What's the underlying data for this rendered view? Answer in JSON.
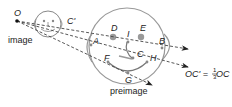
{
  "diagram": {
    "type": "dilation",
    "center_label": "O",
    "image_caption": "image",
    "preimage_caption": "preimage",
    "equation": {
      "lhs": "OC' = ",
      "num": "1",
      "den": "3",
      "rhs": " OC"
    },
    "points": {
      "A": "A",
      "B": "B",
      "C": "C",
      "C_prime": "C'",
      "D": "D",
      "E": "E",
      "F": "F",
      "G": "G",
      "H": "H",
      "I": "I"
    },
    "colors": {
      "stroke": "#888888",
      "dash": "#444444",
      "point": "#999999",
      "text": "#222222"
    }
  }
}
